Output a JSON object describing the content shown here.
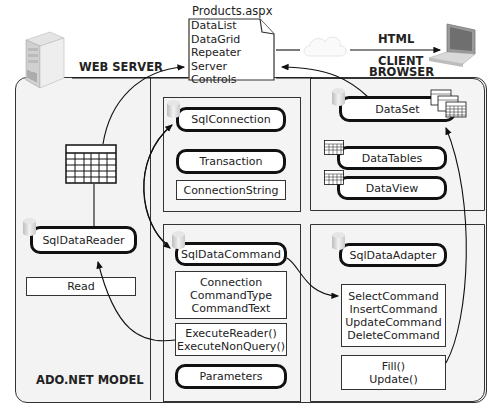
{
  "diagram": {
    "page_file": {
      "title": "Products.aspx",
      "items": [
        "DataList",
        "DataGrid",
        "Repeater",
        "Server Controls"
      ]
    },
    "labels": {
      "web_server": "WEB SERVER",
      "html": "HTML",
      "client_browser_line1": "CLIENT",
      "client_browser_line2": "BROWSER",
      "ado_model": "ADO.NET MODEL"
    },
    "reader_panel": {
      "object": "SqlDataReader",
      "method": "Read"
    },
    "connection_panel": {
      "object": "SqlConnection",
      "transaction": "Transaction",
      "property": "ConnectionString"
    },
    "command_panel": {
      "object": "SqlDataCommand",
      "properties": [
        "Connection",
        "CommandType",
        "CommandText"
      ],
      "methods": [
        "ExecuteReader()",
        "ExecuteNonQuery()"
      ],
      "parameters": "Parameters"
    },
    "dataset_panel": {
      "object": "DataSet",
      "tables": "DataTables",
      "view": "DataView"
    },
    "adapter_panel": {
      "object": "SqlDataAdapter",
      "commands": [
        "SelectCommand",
        "InsertCommand",
        "UpdateCommand",
        "DeleteCommand"
      ],
      "methods": [
        "Fill()",
        "Update()"
      ]
    },
    "icons": {
      "server": "server-tower-icon",
      "laptop": "laptop-icon",
      "database": "database-cylinder-icon",
      "table": "table-grid-icon"
    },
    "colors": {
      "panel_bg": "#f2f2f2",
      "line": "#111111",
      "box_bg": "#ffffff"
    }
  }
}
